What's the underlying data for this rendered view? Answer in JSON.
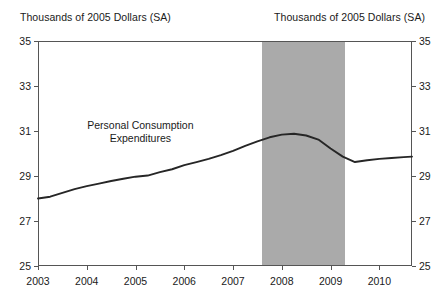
{
  "axis_labels": {
    "left_unit": "Thousands of 2005 Dollars (SA)",
    "right_unit": "Thousands of 2005 Dollars (SA)"
  },
  "annotation": {
    "line1": "Personal Consumption",
    "line2": "Expenditures"
  },
  "colors": {
    "line": "#262626",
    "recession_band": "#aaaaaa",
    "axis": "#555555",
    "text": "#1a1a1a",
    "background": "#ffffff"
  },
  "chart_data": {
    "type": "line",
    "title": "",
    "subtitle": "",
    "xlabel": "",
    "ylabel": "Thousands of 2005 Dollars (SA)",
    "ylabel_right": "Thousands of 2005 Dollars (SA)",
    "xlim": [
      2003.0,
      2010.67
    ],
    "ylim": [
      25,
      35
    ],
    "yticks": [
      25,
      27,
      29,
      31,
      33,
      35
    ],
    "ytick_labels": [
      "25",
      "27",
      "29",
      "31",
      "33",
      "35"
    ],
    "xticks": [
      2003,
      2004,
      2005,
      2006,
      2007,
      2008,
      2009,
      2010
    ],
    "xtick_labels": [
      "2003",
      "2004",
      "2005",
      "2006",
      "2007",
      "2008",
      "2009",
      "2010"
    ],
    "grid": false,
    "legend": "none",
    "dual_y_axis": true,
    "annotations": [
      {
        "text": "Personal Consumption Expenditures",
        "x": 2005.1,
        "y": 31.55
      }
    ],
    "shaded_regions": [
      {
        "label": "recession",
        "x_start": 2007.6,
        "x_end": 2009.3,
        "color": "#aaaaaa"
      }
    ],
    "series": [
      {
        "name": "Personal Consumption Expenditures",
        "x": [
          2003.0,
          2003.25,
          2003.5,
          2003.75,
          2004.0,
          2004.25,
          2004.5,
          2004.75,
          2005.0,
          2005.25,
          2005.5,
          2005.75,
          2006.0,
          2006.25,
          2006.5,
          2006.75,
          2007.0,
          2007.25,
          2007.5,
          2007.75,
          2008.0,
          2008.25,
          2008.5,
          2008.75,
          2009.0,
          2009.25,
          2009.5,
          2009.75,
          2010.0,
          2010.25,
          2010.5,
          2010.67
        ],
        "values": [
          28.0,
          28.08,
          28.25,
          28.42,
          28.55,
          28.66,
          28.78,
          28.88,
          28.97,
          29.02,
          29.17,
          29.3,
          29.48,
          29.62,
          29.76,
          29.93,
          30.12,
          30.34,
          30.54,
          30.72,
          30.84,
          30.88,
          30.8,
          30.62,
          30.22,
          29.86,
          29.62,
          29.7,
          29.76,
          29.8,
          29.84,
          29.86
        ]
      }
    ]
  }
}
